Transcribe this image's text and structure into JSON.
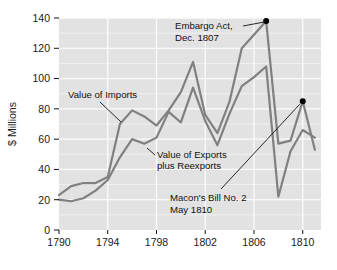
{
  "chart_data": {
    "type": "line",
    "title": "",
    "xlabel": "",
    "ylabel": "$ Millions",
    "xlim": [
      1790,
      1811.5
    ],
    "ylim": [
      0,
      140
    ],
    "grid": true,
    "legend_position": "inline-labels",
    "x_ticks": [
      "1790",
      "1794",
      "1798",
      "1802",
      "1806",
      "1810"
    ],
    "x_tick_values": [
      1790,
      1794,
      1798,
      1802,
      1806,
      1810
    ],
    "y_ticks": [
      "0",
      "20",
      "40",
      "60",
      "80",
      "100",
      "120",
      "140"
    ],
    "y_tick_values": [
      0,
      20,
      40,
      60,
      80,
      100,
      120,
      140
    ],
    "x": [
      1790,
      1791,
      1792,
      1793,
      1794,
      1795,
      1796,
      1797,
      1798,
      1799,
      1800,
      1801,
      1802,
      1803,
      1804,
      1805,
      1806,
      1807,
      1808,
      1809,
      1810,
      1811
    ],
    "series": [
      {
        "name": "Value of Imports",
        "color": "#808080",
        "values": [
          23,
          29,
          31,
          31,
          35,
          70,
          79,
          75,
          69,
          79,
          91,
          111,
          76,
          64,
          85,
          120,
          129,
          138,
          57,
          59,
          85,
          53
        ]
      },
      {
        "name": "Value of Exports plus Reexports",
        "color": "#808080",
        "values": [
          20,
          19,
          21,
          26,
          33,
          48,
          60,
          57,
          61,
          78,
          71,
          94,
          72,
          56,
          77,
          95,
          101,
          108,
          22,
          52,
          66,
          61
        ]
      }
    ],
    "annotations": [
      {
        "id": "embargo-act",
        "text_line1": "Embargo Act,",
        "text_line2": "Dec. 1807",
        "point_x": 1807,
        "point_y": 138,
        "marker": "dot"
      },
      {
        "id": "macons-bill",
        "text_line1": "Macon's Bill No. 2",
        "text_line2": "May 1810",
        "point_x": 1810,
        "point_y": 85,
        "marker": "dot"
      }
    ],
    "series_labels": [
      {
        "id": "imports-label",
        "text": "Value of Imports"
      },
      {
        "id": "exports-label-line1",
        "text": "Value of Exports"
      },
      {
        "id": "exports-label-line2",
        "text": "plus Reexports"
      }
    ],
    "colors": {
      "plot_background": "#e2e2e2",
      "gridline": "#fbfbfb",
      "line": "#7d7d7d",
      "text": "#111111",
      "marker": "#000000",
      "page_background": "#ffffff"
    }
  }
}
